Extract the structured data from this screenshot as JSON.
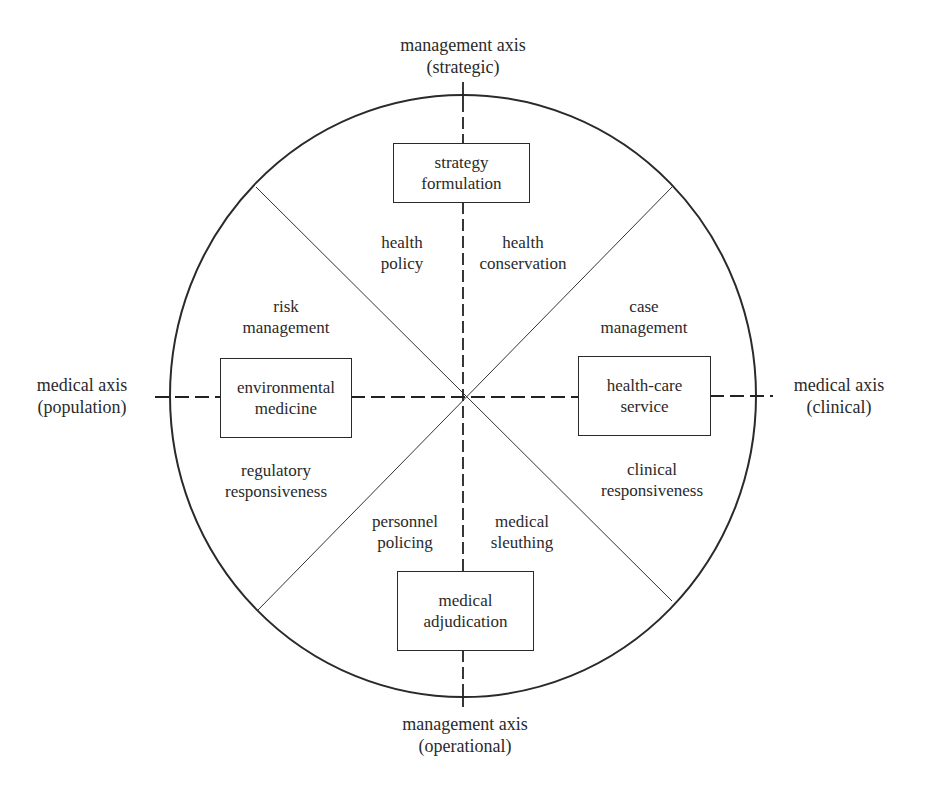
{
  "diagram": {
    "type": "circular-quadrant-diagram",
    "axes": {
      "top": {
        "line1": "management axis",
        "line2": "(strategic)"
      },
      "bottom": {
        "line1": "management axis",
        "line2": "(operational)"
      },
      "left": {
        "line1": "medical axis",
        "line2": "(population)"
      },
      "right": {
        "line1": "medical axis",
        "line2": "(clinical)"
      }
    },
    "boxes": {
      "top": {
        "line1": "strategy",
        "line2": "formulation"
      },
      "bottom": {
        "line1": "medical",
        "line2": "adjudication"
      },
      "left": {
        "line1": "environmental",
        "line2": "medicine"
      },
      "right": {
        "line1": "health-care",
        "line2": "service"
      }
    },
    "sectors": [
      {
        "id": "health-policy",
        "line1": "health",
        "line2": "policy"
      },
      {
        "id": "health-conservation",
        "line1": "health",
        "line2": "conservation"
      },
      {
        "id": "risk-management",
        "line1": "risk",
        "line2": "management"
      },
      {
        "id": "case-management",
        "line1": "case",
        "line2": "management"
      },
      {
        "id": "regulatory-responsiveness",
        "line1": "regulatory",
        "line2": "responsiveness"
      },
      {
        "id": "clinical-responsiveness",
        "line1": "clinical",
        "line2": "responsiveness"
      },
      {
        "id": "personnel-policing",
        "line1": "personnel",
        "line2": "policing"
      },
      {
        "id": "medical-sleuthing",
        "line1": "medical",
        "line2": "sleuthing"
      }
    ],
    "colors": {
      "stroke": "#2a2a2a",
      "background": "#ffffff"
    }
  }
}
